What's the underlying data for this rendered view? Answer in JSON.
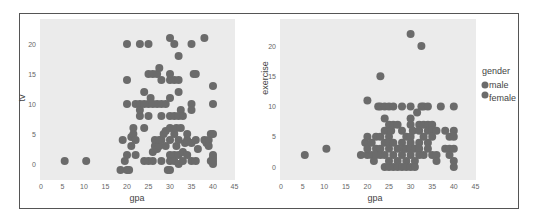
{
  "chart_data": [
    {
      "type": "scatter",
      "title": "",
      "xlabel": "gpa",
      "ylabel": "tv",
      "xlim": [
        0,
        45
      ],
      "ylim": [
        -1.5,
        23
      ],
      "xticks": [
        0,
        5,
        10,
        15,
        20,
        25,
        30,
        35,
        40,
        45
      ],
      "yticks": [
        0,
        5,
        10,
        15,
        20
      ],
      "grid": false,
      "background": "#ebebeb",
      "point_color": "#6b6b6b",
      "points": [
        [
          5.5,
          0.5
        ],
        [
          10.5,
          0.5
        ],
        [
          18.5,
          -1
        ],
        [
          19,
          4
        ],
        [
          19.5,
          0.5
        ],
        [
          20,
          -1
        ],
        [
          20,
          1.5
        ],
        [
          20,
          20
        ],
        [
          20,
          14
        ],
        [
          20,
          10
        ],
        [
          20.5,
          -1
        ],
        [
          21,
          3
        ],
        [
          21,
          4.5
        ],
        [
          21.5,
          5
        ],
        [
          21.5,
          6
        ],
        [
          22,
          1.5
        ],
        [
          22,
          10
        ],
        [
          22,
          4
        ],
        [
          23,
          20
        ],
        [
          23,
          10
        ],
        [
          23,
          8
        ],
        [
          23,
          9
        ],
        [
          24,
          10
        ],
        [
          24,
          6
        ],
        [
          24,
          12
        ],
        [
          24,
          0.5
        ],
        [
          25,
          20
        ],
        [
          25,
          10
        ],
        [
          25,
          8
        ],
        [
          25,
          15
        ],
        [
          25,
          0.5
        ],
        [
          25.5,
          11
        ],
        [
          26,
          10
        ],
        [
          26,
          15
        ],
        [
          26,
          0.5
        ],
        [
          26,
          2
        ],
        [
          26.5,
          3
        ],
        [
          26.5,
          4
        ],
        [
          27,
          15
        ],
        [
          27,
          10
        ],
        [
          27,
          2.5
        ],
        [
          27.5,
          16
        ],
        [
          27.5,
          3
        ],
        [
          27.5,
          4
        ],
        [
          28,
          14
        ],
        [
          28,
          10
        ],
        [
          28,
          8
        ],
        [
          28,
          0.5
        ],
        [
          28,
          4
        ],
        [
          28.5,
          5
        ],
        [
          29,
          10
        ],
        [
          29,
          3
        ],
        [
          29,
          5.5
        ],
        [
          29.5,
          -1
        ],
        [
          30,
          21
        ],
        [
          30,
          15
        ],
        [
          30,
          14
        ],
        [
          30,
          11
        ],
        [
          30,
          8
        ],
        [
          30,
          6
        ],
        [
          30,
          4
        ],
        [
          30,
          1.5
        ],
        [
          30,
          0.5
        ],
        [
          30,
          -1
        ],
        [
          31,
          20
        ],
        [
          31,
          14
        ],
        [
          31,
          8
        ],
        [
          31,
          5
        ],
        [
          31,
          1.5
        ],
        [
          31,
          0.5
        ],
        [
          31.5,
          6
        ],
        [
          31.5,
          3
        ],
        [
          32,
          18
        ],
        [
          32,
          14
        ],
        [
          32,
          12
        ],
        [
          32,
          8
        ],
        [
          32,
          4
        ],
        [
          32,
          1.5
        ],
        [
          32,
          0
        ],
        [
          32.5,
          6
        ],
        [
          32.5,
          9
        ],
        [
          33,
          8
        ],
        [
          33,
          2
        ],
        [
          33,
          0.5
        ],
        [
          33.5,
          3.5
        ],
        [
          34,
          4
        ],
        [
          34,
          1.5
        ],
        [
          34,
          5
        ],
        [
          35,
          20
        ],
        [
          35,
          10
        ],
        [
          35,
          9
        ],
        [
          35,
          0.5
        ],
        [
          35,
          3.5
        ],
        [
          35.5,
          15
        ],
        [
          36,
          15
        ],
        [
          36,
          4
        ],
        [
          36,
          0.5
        ],
        [
          36.5,
          2.5
        ],
        [
          38,
          21
        ],
        [
          38,
          4
        ],
        [
          38.5,
          3.5
        ],
        [
          39,
          4
        ],
        [
          39,
          3
        ],
        [
          39.5,
          5
        ],
        [
          39.5,
          0.5
        ],
        [
          40,
          5
        ],
        [
          40,
          10
        ],
        [
          40,
          13
        ],
        [
          40,
          1
        ],
        [
          40,
          0.5
        ],
        [
          40,
          0
        ],
        [
          40,
          1.5
        ]
      ]
    },
    {
      "type": "scatter",
      "title": "",
      "xlabel": "gpa",
      "ylabel": "exercise",
      "xlim": [
        0,
        45
      ],
      "ylim": [
        -1.5,
        23
      ],
      "xticks": [
        0,
        5,
        10,
        15,
        20,
        25,
        30,
        35,
        40,
        45
      ],
      "yticks": [
        0,
        5,
        10,
        15,
        20
      ],
      "grid": false,
      "background": "#ebebeb",
      "point_color": "#6b6b6b",
      "points": [
        [
          5.5,
          2
        ],
        [
          10.5,
          3
        ],
        [
          18.5,
          2
        ],
        [
          19.5,
          4
        ],
        [
          20,
          11
        ],
        [
          20,
          5
        ],
        [
          20,
          2
        ],
        [
          20,
          3
        ],
        [
          21,
          4
        ],
        [
          21,
          2
        ],
        [
          21.5,
          1
        ],
        [
          22,
          5
        ],
        [
          22,
          3
        ],
        [
          22,
          2
        ],
        [
          22.5,
          10
        ],
        [
          23,
          15
        ],
        [
          23,
          10
        ],
        [
          23,
          5
        ],
        [
          23,
          3
        ],
        [
          23,
          2
        ],
        [
          24,
          10
        ],
        [
          24,
          8
        ],
        [
          24,
          6
        ],
        [
          24,
          4
        ],
        [
          24,
          2
        ],
        [
          24,
          0
        ],
        [
          25,
          10
        ],
        [
          25,
          7
        ],
        [
          25,
          5
        ],
        [
          25,
          4
        ],
        [
          25,
          3
        ],
        [
          25,
          1
        ],
        [
          25,
          0
        ],
        [
          25.5,
          6
        ],
        [
          26,
          10
        ],
        [
          26,
          7
        ],
        [
          26,
          4
        ],
        [
          26,
          2
        ],
        [
          26,
          0
        ],
        [
          27,
          7
        ],
        [
          27,
          3
        ],
        [
          27,
          1
        ],
        [
          27,
          0
        ],
        [
          28,
          10
        ],
        [
          28,
          6
        ],
        [
          28,
          4
        ],
        [
          28,
          2
        ],
        [
          28,
          0
        ],
        [
          28.5,
          3
        ],
        [
          29,
          5
        ],
        [
          29,
          3
        ],
        [
          29,
          1
        ],
        [
          29,
          0
        ],
        [
          30,
          22
        ],
        [
          30,
          10
        ],
        [
          30,
          8
        ],
        [
          30,
          7
        ],
        [
          30,
          5
        ],
        [
          30,
          4
        ],
        [
          30,
          3
        ],
        [
          30,
          2
        ],
        [
          30,
          0
        ],
        [
          30.5,
          6
        ],
        [
          31,
          3
        ],
        [
          31,
          1
        ],
        [
          31,
          0
        ],
        [
          31.5,
          9
        ],
        [
          32,
          7
        ],
        [
          32,
          6
        ],
        [
          32,
          4
        ],
        [
          32,
          3
        ],
        [
          32,
          2
        ],
        [
          32.5,
          20
        ],
        [
          32.5,
          10
        ],
        [
          33,
          10
        ],
        [
          33,
          7
        ],
        [
          33,
          5
        ],
        [
          33,
          2
        ],
        [
          34,
          7
        ],
        [
          34,
          6
        ],
        [
          34,
          4
        ],
        [
          34,
          3
        ],
        [
          34,
          10
        ],
        [
          35,
          7
        ],
        [
          35,
          6
        ],
        [
          35,
          5
        ],
        [
          35,
          2
        ],
        [
          36,
          6
        ],
        [
          36,
          2
        ],
        [
          36,
          1
        ],
        [
          37,
          10
        ],
        [
          38,
          6
        ],
        [
          38,
          3
        ],
        [
          39,
          5
        ],
        [
          39,
          3
        ],
        [
          39,
          2
        ],
        [
          40,
          10
        ],
        [
          40,
          6
        ],
        [
          40,
          5
        ],
        [
          40,
          3
        ],
        [
          40,
          1
        ],
        [
          40,
          0
        ]
      ]
    }
  ],
  "legend": {
    "title": "gender",
    "items": [
      {
        "label": "male",
        "color": "#6b6b6b"
      },
      {
        "label": "female",
        "color": "#6b6b6b"
      }
    ]
  },
  "panels": [
    {
      "xlabel": "gpa",
      "ylabel": "tv"
    },
    {
      "xlabel": "gpa",
      "ylabel": "exercise"
    }
  ],
  "tick_labels_x": [
    "0",
    "5",
    "10",
    "15",
    "20",
    "25",
    "30",
    "35",
    "40",
    "45"
  ],
  "tick_labels_y": [
    "0",
    "5",
    "10",
    "15",
    "20"
  ]
}
